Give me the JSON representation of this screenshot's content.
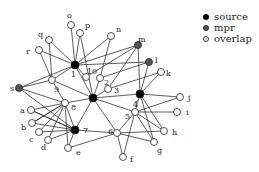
{
  "legend": {
    "items": [
      {
        "key": "source",
        "label": "source",
        "color": "#000000"
      },
      {
        "key": "mpr",
        "label": "mpr",
        "color": "#555555"
      },
      {
        "key": "overlap",
        "label": "overlap",
        "color": "#dddddd"
      }
    ]
  },
  "graph": {
    "nodes": [
      {
        "id": "C",
        "label": "",
        "type": "source",
        "x": 93,
        "y": 98
      },
      {
        "id": "1",
        "label": "1",
        "type": "source",
        "x": 75,
        "y": 65,
        "lx": 71,
        "ly": 77
      },
      {
        "id": "4",
        "label": "4",
        "type": "source",
        "x": 140,
        "y": 94,
        "lx": 133,
        "ly": 107
      },
      {
        "id": "7",
        "label": "7",
        "type": "source",
        "x": 75,
        "y": 130,
        "lx": 83,
        "ly": 133
      },
      {
        "id": "m",
        "label": "m",
        "type": "mpr",
        "x": 138,
        "y": 45,
        "lx": 138,
        "ly": 42
      },
      {
        "id": "l",
        "label": "l",
        "type": "mpr",
        "x": 149,
        "y": 62,
        "lx": 155,
        "ly": 63
      },
      {
        "id": "s",
        "label": "s",
        "type": "mpr",
        "x": 19,
        "y": 88,
        "lx": 10,
        "ly": 91
      },
      {
        "id": "o",
        "label": "o",
        "type": "overlap",
        "x": 71,
        "y": 25,
        "lx": 67,
        "ly": 18
      },
      {
        "id": "p",
        "label": "p",
        "type": "overlap",
        "x": 80,
        "y": 33,
        "lx": 85,
        "ly": 28
      },
      {
        "id": "q",
        "label": "q",
        "type": "overlap",
        "x": 49,
        "y": 40,
        "lx": 38,
        "ly": 37
      },
      {
        "id": "r",
        "label": "r",
        "type": "overlap",
        "x": 39,
        "y": 50,
        "lx": 26,
        "ly": 54
      },
      {
        "id": "n",
        "label": "n",
        "type": "overlap",
        "x": 111,
        "y": 36,
        "lx": 116,
        "ly": 32
      },
      {
        "id": "k",
        "label": "k",
        "type": "overlap",
        "x": 161,
        "y": 72,
        "lx": 166,
        "ly": 76
      },
      {
        "id": "j",
        "label": "j",
        "type": "overlap",
        "x": 180,
        "y": 97,
        "lx": 188,
        "ly": 100
      },
      {
        "id": "i",
        "label": "i",
        "type": "overlap",
        "x": 177,
        "y": 112,
        "lx": 186,
        "ly": 115
      },
      {
        "id": "h",
        "label": "h",
        "type": "overlap",
        "x": 164,
        "y": 131,
        "lx": 172,
        "ly": 135
      },
      {
        "id": "g",
        "label": "g",
        "type": "overlap",
        "x": 154,
        "y": 142,
        "lx": 157,
        "ly": 153
      },
      {
        "id": "f",
        "label": "f",
        "type": "overlap",
        "x": 123,
        "y": 157,
        "lx": 130,
        "ly": 162
      },
      {
        "id": "e",
        "label": "e",
        "type": "overlap",
        "x": 68,
        "y": 148,
        "lx": 76,
        "ly": 155
      },
      {
        "id": "d",
        "label": "d",
        "type": "overlap",
        "x": 48,
        "y": 140,
        "lx": 41,
        "ly": 150
      },
      {
        "id": "c",
        "label": "c",
        "type": "overlap",
        "x": 39,
        "y": 132,
        "lx": 29,
        "ly": 142
      },
      {
        "id": "b",
        "label": "b",
        "type": "overlap",
        "x": 32,
        "y": 123,
        "lx": 21,
        "ly": 130
      },
      {
        "id": "a",
        "label": "a",
        "type": "overlap",
        "x": 31,
        "y": 110,
        "lx": 20,
        "ly": 113
      },
      {
        "id": "8",
        "label": "8",
        "type": "overlap",
        "x": 65,
        "y": 103,
        "lx": 71,
        "ly": 110
      },
      {
        "id": "9",
        "label": "9",
        "type": "overlap",
        "x": 52,
        "y": 80,
        "lx": 54,
        "ly": 92
      },
      {
        "id": "10",
        "label": "10",
        "type": "overlap",
        "x": 86,
        "y": 77,
        "lx": 87,
        "ly": 74
      },
      {
        "id": "2",
        "label": "2",
        "type": "overlap",
        "x": 100,
        "y": 78,
        "lx": 104,
        "ly": 85
      },
      {
        "id": "3",
        "label": "3",
        "type": "overlap",
        "x": 108,
        "y": 89,
        "lx": 114,
        "ly": 93
      },
      {
        "id": "5",
        "label": "5",
        "type": "overlap",
        "x": 135,
        "y": 112,
        "lx": 125,
        "ly": 119
      },
      {
        "id": "6",
        "label": "6",
        "type": "overlap",
        "x": 117,
        "y": 133,
        "lx": 108,
        "ly": 134
      }
    ],
    "edges": [
      [
        "1",
        "o"
      ],
      [
        "1",
        "p"
      ],
      [
        "1",
        "q"
      ],
      [
        "1",
        "r"
      ],
      [
        "1",
        "n"
      ],
      [
        "1",
        "m"
      ],
      [
        "1",
        "10"
      ],
      [
        "1",
        "9"
      ],
      [
        "1",
        "l"
      ],
      [
        "1",
        "C"
      ],
      [
        "1",
        "s"
      ],
      [
        "p",
        "C"
      ],
      [
        "q",
        "9"
      ],
      [
        "r",
        "9"
      ],
      [
        "9",
        "s"
      ],
      [
        "9",
        "8"
      ],
      [
        "9",
        "C"
      ],
      [
        "n",
        "2"
      ],
      [
        "m",
        "10"
      ],
      [
        "m",
        "4"
      ],
      [
        "m",
        "3"
      ],
      [
        "l",
        "4"
      ],
      [
        "l",
        "2"
      ],
      [
        "k",
        "4"
      ],
      [
        "k",
        "3"
      ],
      [
        "C",
        "4"
      ],
      [
        "C",
        "7"
      ],
      [
        "C",
        "8"
      ],
      [
        "C",
        "6"
      ],
      [
        "C",
        "5"
      ],
      [
        "C",
        "2"
      ],
      [
        "C",
        "3"
      ],
      [
        "4",
        "j"
      ],
      [
        "4",
        "5"
      ],
      [
        "4",
        "h"
      ],
      [
        "4",
        "g"
      ],
      [
        "j",
        "5"
      ],
      [
        "i",
        "5"
      ],
      [
        "5",
        "6"
      ],
      [
        "5",
        "f"
      ],
      [
        "5",
        "h"
      ],
      [
        "5",
        "g"
      ],
      [
        "6",
        "f"
      ],
      [
        "6",
        "g"
      ],
      [
        "6",
        "7"
      ],
      [
        "6",
        "h"
      ],
      [
        "6",
        "e"
      ],
      [
        "7",
        "8"
      ],
      [
        "7",
        "a"
      ],
      [
        "7",
        "b"
      ],
      [
        "7",
        "c"
      ],
      [
        "7",
        "d"
      ],
      [
        "7",
        "e"
      ],
      [
        "7",
        "s"
      ],
      [
        "8",
        "a"
      ],
      [
        "8",
        "b"
      ],
      [
        "8",
        "c"
      ],
      [
        "8",
        "d"
      ],
      [
        "8",
        "e"
      ],
      [
        "a",
        "7"
      ],
      [
        "b",
        "8"
      ],
      [
        "8",
        "s"
      ]
    ]
  }
}
